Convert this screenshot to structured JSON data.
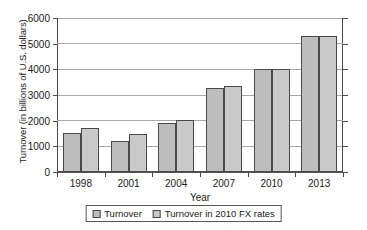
{
  "chart_data": {
    "type": "bar",
    "title": "",
    "xlabel": "Year",
    "ylabel": "Turnover (in billions of U.S. dollars)",
    "categories": [
      "1998",
      "2001",
      "2004",
      "2007",
      "2010",
      "2013"
    ],
    "series": [
      {
        "name": "Turnover",
        "values": [
          1530,
          1220,
          1900,
          3280,
          4000,
          5310
        ]
      },
      {
        "name": "Turnover in 2010 FX rates",
        "values": [
          1730,
          1480,
          2010,
          3350,
          4000,
          5310
        ]
      }
    ],
    "ylim": [
      0,
      6000
    ],
    "yticks": [
      0,
      1000,
      2000,
      3000,
      4000,
      5000,
      6000
    ],
    "ytick_labels": [
      "0",
      "1000",
      "2000",
      "3000",
      "4000",
      "5000",
      "6000"
    ],
    "grid": true,
    "legend_position": "bottom",
    "colors": {
      "series_0": "#bdbdbd",
      "series_1": "#c9c9c9",
      "bar_outline": "#4a4a4a",
      "gridline": "#a9a9a9",
      "axis": "#4d4d4d",
      "background": "#ffffff",
      "text": "#1a1a1a"
    }
  }
}
